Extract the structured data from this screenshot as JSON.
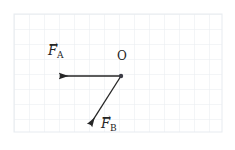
{
  "figure": {
    "width": 235,
    "height": 150,
    "background_color": "#ffffff",
    "grid": {
      "visible": true,
      "line_color": "#e7ebf0",
      "cell_size": 15,
      "left": 14,
      "top": 14,
      "right": 222,
      "bottom": 132
    }
  },
  "labels": {
    "origin": "O",
    "force_a": {
      "symbol": "F",
      "subscript": "A",
      "hat": "→"
    },
    "force_b": {
      "symbol": "F",
      "subscript": "B",
      "hat": "→"
    }
  },
  "chart_data": {
    "type": "diagram",
    "subtype": "vector-force-diagram",
    "title": "",
    "stroke_color": "#262626",
    "stroke_width": 1.3,
    "origin_point": {
      "name": "O",
      "x": 121,
      "y": 76,
      "dot_radius": 2.2
    },
    "vectors": [
      {
        "name": "F_A",
        "label": "F",
        "subscript": "A",
        "from": {
          "x": 121,
          "y": 76
        },
        "to": {
          "x": 56,
          "y": 76
        },
        "direction_deg": 180,
        "length_px": 65,
        "label_pos": {
          "x": 48,
          "y": 44
        }
      },
      {
        "name": "F_B",
        "label": "F",
        "subscript": "B",
        "from": {
          "x": 121,
          "y": 76
        },
        "to": {
          "x": 88,
          "y": 128
        },
        "direction_deg": 237.6,
        "length_px": 61.6,
        "label_pos": {
          "x": 101,
          "y": 118
        }
      }
    ],
    "origin_label_pos": {
      "x": 117,
      "y": 52
    }
  }
}
